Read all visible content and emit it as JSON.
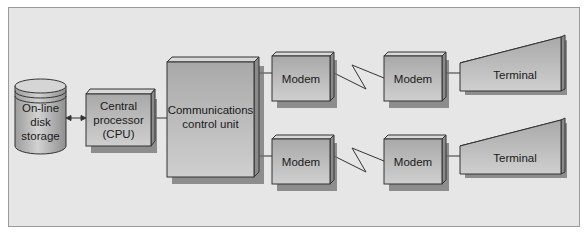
{
  "diagram": {
    "type": "network-block-diagram",
    "nodes": {
      "disk": {
        "label_lines": [
          "On-line",
          "disk",
          "storage"
        ],
        "shape": "cylinder"
      },
      "cpu": {
        "label_lines": [
          "Central",
          "processor",
          "(CPU)"
        ],
        "shape": "3d-box"
      },
      "ccu": {
        "label_lines": [
          "Communications",
          "control unit"
        ],
        "shape": "3d-box"
      },
      "modem_top_1": {
        "label": "Modem",
        "shape": "3d-box"
      },
      "modem_top_2": {
        "label": "Modem",
        "shape": "3d-box"
      },
      "terminal_top": {
        "label": "Terminal",
        "shape": "wedge"
      },
      "modem_bot_1": {
        "label": "Modem",
        "shape": "3d-box"
      },
      "modem_bot_2": {
        "label": "Modem",
        "shape": "3d-box"
      },
      "terminal_bot": {
        "label": "Terminal",
        "shape": "wedge"
      }
    },
    "edges": [
      {
        "from": "disk",
        "to": "cpu",
        "style": "bidirectional-arrow"
      },
      {
        "from": "cpu",
        "to": "ccu",
        "style": "line"
      },
      {
        "from": "ccu",
        "to": "modem_top_1",
        "style": "line"
      },
      {
        "from": "modem_top_1",
        "to": "modem_top_2",
        "style": "lightning-zigzag"
      },
      {
        "from": "modem_top_2",
        "to": "terminal_top",
        "style": "line"
      },
      {
        "from": "ccu",
        "to": "modem_bot_1",
        "style": "line"
      },
      {
        "from": "modem_bot_1",
        "to": "modem_bot_2",
        "style": "lightning-zigzag"
      },
      {
        "from": "modem_bot_2",
        "to": "terminal_bot",
        "style": "line"
      }
    ],
    "colors": {
      "background": "#e6e6e6",
      "box_light": "#c4c4c4",
      "box_dark": "#9e9e9e",
      "shadow": "#6f6f6f",
      "line": "#333333"
    }
  }
}
